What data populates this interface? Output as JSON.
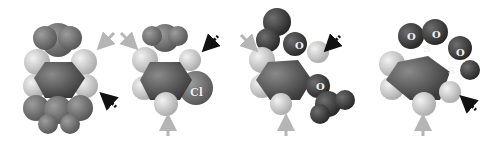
{
  "figure": {
    "panels": [
      {
        "id": "a",
        "labels": []
      },
      {
        "id": "b",
        "labels": [
          "Cl"
        ]
      },
      {
        "id": "c",
        "labels": [
          "O",
          "O"
        ]
      },
      {
        "id": "d",
        "labels": [
          "O",
          "O",
          "S",
          "O",
          "S"
        ]
      }
    ],
    "arrow_legend": {
      "gray_solid": "gray solid arrow",
      "black_dashed": "black dashed arrow"
    },
    "colors": {
      "hydrogen": "#cfcfcf",
      "carbon": "#555555",
      "heteroatom": "#6a6a6a",
      "gray_arrow": "#b5b5b5",
      "black_arrow": "#111111"
    }
  }
}
